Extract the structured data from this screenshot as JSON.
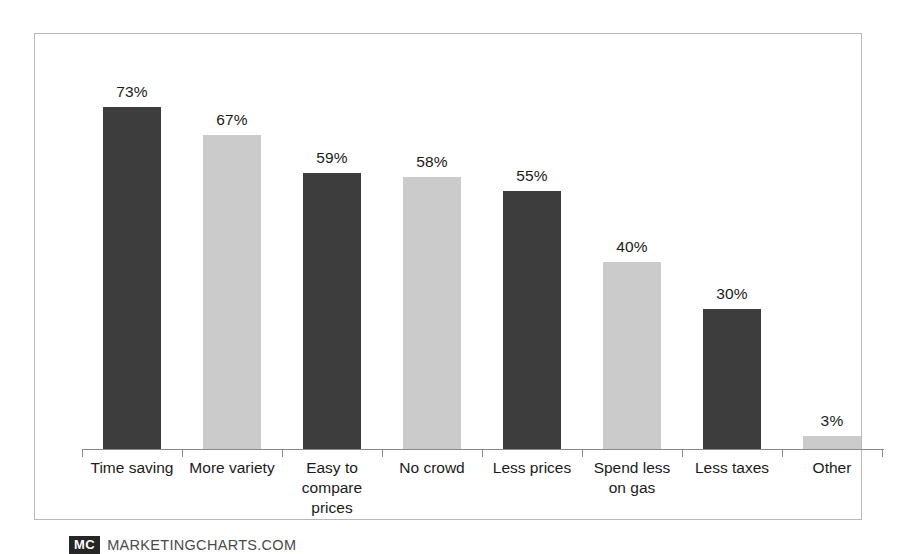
{
  "attribution": {
    "logo_text": "MC",
    "site": "MARKETINGCHARTS.COM"
  },
  "colors": {
    "dark_bar": "#3d3d3d",
    "light_bar": "#cbcbcb",
    "frame": "#b9b9b9",
    "axis": "#8a8a8a",
    "text": "#1b1b1b"
  },
  "chart_data": {
    "type": "bar",
    "title": "",
    "xlabel": "",
    "ylabel": "",
    "ylim": [
      0,
      80
    ],
    "grid": false,
    "legend": "none",
    "value_suffix": "%",
    "categories": [
      "Time saving",
      "More variety",
      "Easy to compare prices",
      "No crowd",
      "Less prices",
      "Spend less on gas",
      "Less taxes",
      "Other"
    ],
    "category_lines": [
      [
        "Time saving"
      ],
      [
        "More variety"
      ],
      [
        "Easy to",
        "compare",
        "prices"
      ],
      [
        "No crowd"
      ],
      [
        "Less prices"
      ],
      [
        "Spend less",
        "on gas"
      ],
      [
        "Less taxes"
      ],
      [
        "Other"
      ]
    ],
    "values": [
      73,
      67,
      59,
      58,
      55,
      40,
      30,
      3
    ],
    "value_labels": [
      "73%",
      "67%",
      "59%",
      "58%",
      "55%",
      "40%",
      "30%",
      "3%"
    ],
    "bar_shades": [
      "dark",
      "light",
      "dark",
      "light",
      "dark",
      "light",
      "dark",
      "light"
    ]
  }
}
